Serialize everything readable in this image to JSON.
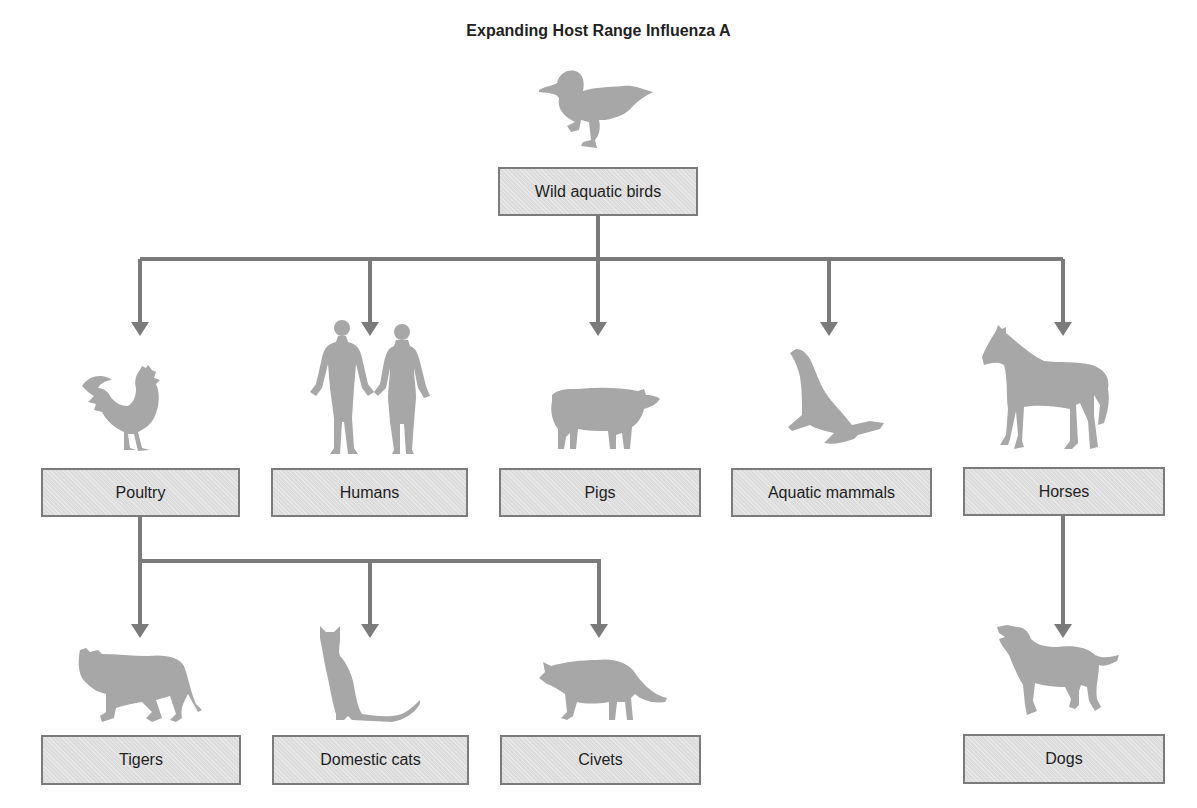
{
  "title": "Expanding Host Range Influenza A",
  "colors": {
    "line": "#7b7b7b",
    "box_fill": "#dcdcdc",
    "box_border": "#7b7b7b",
    "silhouette": "#a7a7a7",
    "text": "#1e1e1e"
  },
  "root": {
    "label": "Wild aquatic birds",
    "icon": "duck-icon"
  },
  "level1": [
    {
      "label": "Poultry",
      "icon": "rooster-icon"
    },
    {
      "label": "Humans",
      "icon": "human-couple-icon"
    },
    {
      "label": "Pigs",
      "icon": "pig-icon"
    },
    {
      "label": "Aquatic mammals",
      "icon": "sea-lion-icon"
    },
    {
      "label": "Horses",
      "icon": "horse-icon"
    }
  ],
  "level2_from_poultry": [
    {
      "label": "Tigers",
      "icon": "tiger-icon"
    },
    {
      "label": "Domestic cats",
      "icon": "cat-icon"
    },
    {
      "label": "Civets",
      "icon": "civet-icon"
    }
  ],
  "level2_from_horses": [
    {
      "label": "Dogs",
      "icon": "dog-icon"
    }
  ]
}
